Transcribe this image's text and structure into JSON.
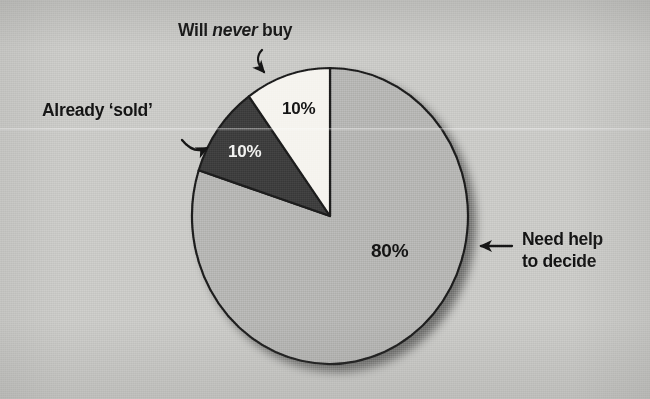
{
  "figure": {
    "background_color": "#c9c9c6",
    "outline_color": "#1a1a1a"
  },
  "chart_data": {
    "type": "pie",
    "title": "",
    "subtitle": "",
    "xlabel": "",
    "ylabel": "",
    "legend_position": "callout-annotations",
    "grid": false,
    "start_angle_deg": 90,
    "direction": "counterclockwise",
    "categories": [
      "Will never buy",
      "Already 'sold'",
      "Need help to decide"
    ],
    "values": [
      10,
      10,
      80
    ],
    "value_labels": [
      "10%",
      "10%",
      "80%"
    ],
    "colors": [
      "#f5f3ee",
      "#3c3c3c",
      "#b4b4b2"
    ],
    "slices": [
      {
        "name": "will-never-buy",
        "label": "Will never buy",
        "label_html": "Will <em>never</em> buy",
        "value": 10,
        "value_label": "10%",
        "color": "#f5f3ee",
        "value_text_color": "#141414",
        "annotation_arrow": "curved-hook-down"
      },
      {
        "name": "already-sold",
        "label": "Already ‘sold’",
        "label_html": "Already ‘sold’",
        "value": 10,
        "value_label": "10%",
        "color": "#3c3c3c",
        "value_text_color": "#f2f2f0",
        "annotation_arrow": "curved-hook-right"
      },
      {
        "name": "need-help-to-decide",
        "label": "Need help to decide",
        "label_html": "Need help<br>to decide",
        "value": 80,
        "value_label": "80%",
        "color": "#b4b4b2",
        "value_text_color": "#131313",
        "annotation_arrow": "straight-left"
      }
    ]
  }
}
